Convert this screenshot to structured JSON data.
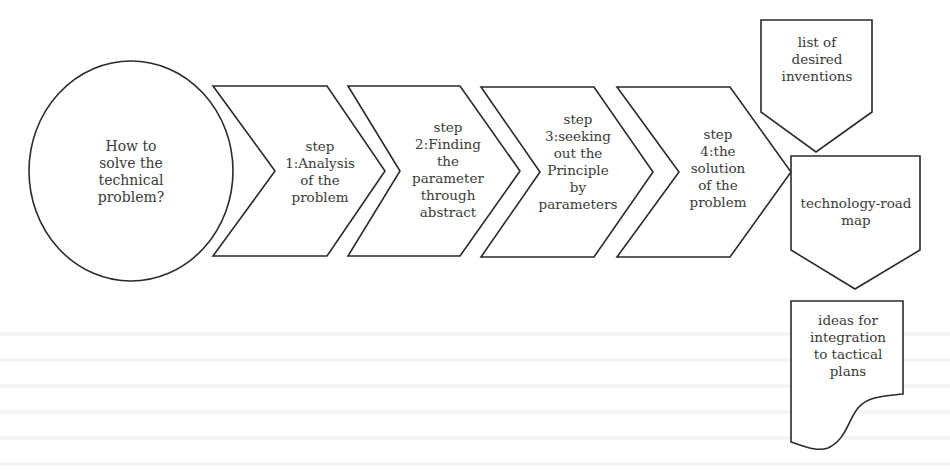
{
  "diagram": {
    "type": "process-flow",
    "start": {
      "text": "How to solve the technical problem?",
      "lines": [
        "How to",
        "solve the",
        "technical",
        "problem?"
      ]
    },
    "steps": [
      {
        "lines": [
          "step",
          "1:Analysis",
          "of the",
          "problem"
        ]
      },
      {
        "lines": [
          "step",
          "2:Finding",
          "the",
          "parameter",
          "through",
          "abstract"
        ]
      },
      {
        "lines": [
          "step",
          "3:seeking",
          "out the",
          "Principle",
          "by",
          "parameters"
        ]
      },
      {
        "lines": [
          "step",
          "4:the",
          "solution",
          "of the",
          "problem"
        ]
      }
    ],
    "outputs": [
      {
        "shape": "offpage-connector",
        "lines": [
          "list of",
          "desired",
          "inventions"
        ]
      },
      {
        "shape": "offpage-connector",
        "lines": [
          "technology-road",
          "map"
        ]
      },
      {
        "shape": "document",
        "lines": [
          "ideas for",
          "integration",
          "to tactical",
          "plans"
        ]
      }
    ],
    "stroke_color": "#2a2a2a",
    "fill_color": "#ffffff"
  }
}
